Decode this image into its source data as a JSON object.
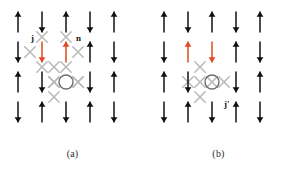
{
  "figure": {
    "type": "spin-lattice-diagram",
    "width": 291,
    "height": 182,
    "background": "#ffffff",
    "colors": {
      "spin_black": "#111111",
      "spin_red": "#e2471f",
      "bond_cross_grey": "#b8b8b8",
      "vortex_circle": "#6e6e6e",
      "caption_text": "#2a2a2a"
    }
  },
  "panels": [
    {
      "id": "a",
      "caption": "(a)",
      "labels": [
        {
          "name": "current-label-j",
          "text": "j",
          "x": 31,
          "y": 34
        },
        {
          "name": "normal-label-n",
          "text": "n",
          "x": 76,
          "y": 34
        }
      ],
      "grid": {
        "cols": 5,
        "rows": 4,
        "x0": 18,
        "y0": 22,
        "dx": 24,
        "dy": 30
      },
      "spins": [
        [
          "up",
          "down",
          "up",
          "down",
          "up"
        ],
        [
          "down",
          "down",
          "up",
          "up",
          "down"
        ],
        [
          "up",
          "down",
          "none",
          "down",
          "up"
        ],
        [
          "down",
          "up",
          "down",
          "up",
          "down"
        ]
      ],
      "spin_colors": [
        [
          "black",
          "black",
          "black",
          "black",
          "black"
        ],
        [
          "black",
          "red",
          "red",
          "black",
          "black"
        ],
        [
          "black",
          "black",
          "none",
          "black",
          "black"
        ],
        [
          "black",
          "black",
          "black",
          "black",
          "black"
        ]
      ],
      "vortex": {
        "col": 2,
        "row": 2,
        "radius": 7
      },
      "crosses": [
        {
          "x": 42,
          "y": 37
        },
        {
          "x": 66,
          "y": 37
        },
        {
          "x": 30,
          "y": 52
        },
        {
          "x": 78,
          "y": 52
        },
        {
          "x": 42,
          "y": 67
        },
        {
          "x": 66,
          "y": 67
        },
        {
          "x": 54,
          "y": 67
        },
        {
          "x": 54,
          "y": 97
        },
        {
          "x": 54,
          "y": 82
        },
        {
          "x": 78,
          "y": 82
        }
      ]
    },
    {
      "id": "b",
      "caption": "(b)",
      "labels": [
        {
          "name": "current-label-j-prime",
          "text": "j'",
          "x": 78,
          "y": 100
        }
      ],
      "grid": {
        "cols": 5,
        "rows": 4,
        "x0": 18,
        "y0": 22,
        "dx": 24,
        "dy": 30
      },
      "spins": [
        [
          "up",
          "down",
          "up",
          "down",
          "up"
        ],
        [
          "down",
          "up",
          "down",
          "up",
          "down"
        ],
        [
          "up",
          "down",
          "none",
          "down",
          "up"
        ],
        [
          "down",
          "up",
          "down",
          "up",
          "down"
        ]
      ],
      "spin_colors": [
        [
          "black",
          "black",
          "black",
          "black",
          "black"
        ],
        [
          "black",
          "red",
          "red",
          "black",
          "black"
        ],
        [
          "black",
          "black",
          "none",
          "black",
          "black"
        ],
        [
          "black",
          "black",
          "black",
          "black",
          "black"
        ]
      ],
      "vortex": {
        "col": 2,
        "row": 2,
        "radius": 7
      },
      "crosses": [
        {
          "x": 54,
          "y": 67
        },
        {
          "x": 42,
          "y": 82
        },
        {
          "x": 66,
          "y": 82
        },
        {
          "x": 54,
          "y": 97
        }
      ]
    }
  ]
}
